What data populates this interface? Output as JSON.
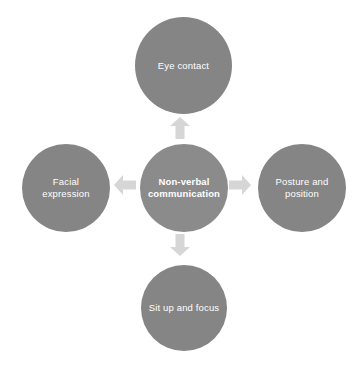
{
  "diagram": {
    "title": "Non-verbal communication",
    "type": "radial-hub-and-spoke",
    "colors": {
      "node_fill": "#858585",
      "center_node_fill": "#8b8b8b",
      "node_text": "#ffffff",
      "arrow_fill": "#d6d6d6",
      "background": "#ffffff"
    },
    "center": {
      "label": "Non-verbal\ncommunication",
      "icon": "circle-node"
    },
    "nodes": [
      {
        "id": "top",
        "label": "Eye contact",
        "position": "top"
      },
      {
        "id": "left",
        "label": "Facial\nexpression",
        "position": "left"
      },
      {
        "id": "right",
        "label": "Posture and\nposition",
        "position": "right"
      },
      {
        "id": "bottom",
        "label": "Sit up and focus",
        "position": "bottom"
      }
    ],
    "arrows": [
      {
        "id": "arrow-up",
        "direction": "up",
        "from": "center",
        "to": "top",
        "icon": "arrow-up-icon"
      },
      {
        "id": "arrow-left",
        "direction": "left",
        "from": "center",
        "to": "left",
        "icon": "arrow-left-icon"
      },
      {
        "id": "arrow-right",
        "direction": "right",
        "from": "center",
        "to": "right",
        "icon": "arrow-right-icon"
      },
      {
        "id": "arrow-down",
        "direction": "down",
        "from": "center",
        "to": "bottom",
        "icon": "arrow-down-icon"
      }
    ]
  }
}
